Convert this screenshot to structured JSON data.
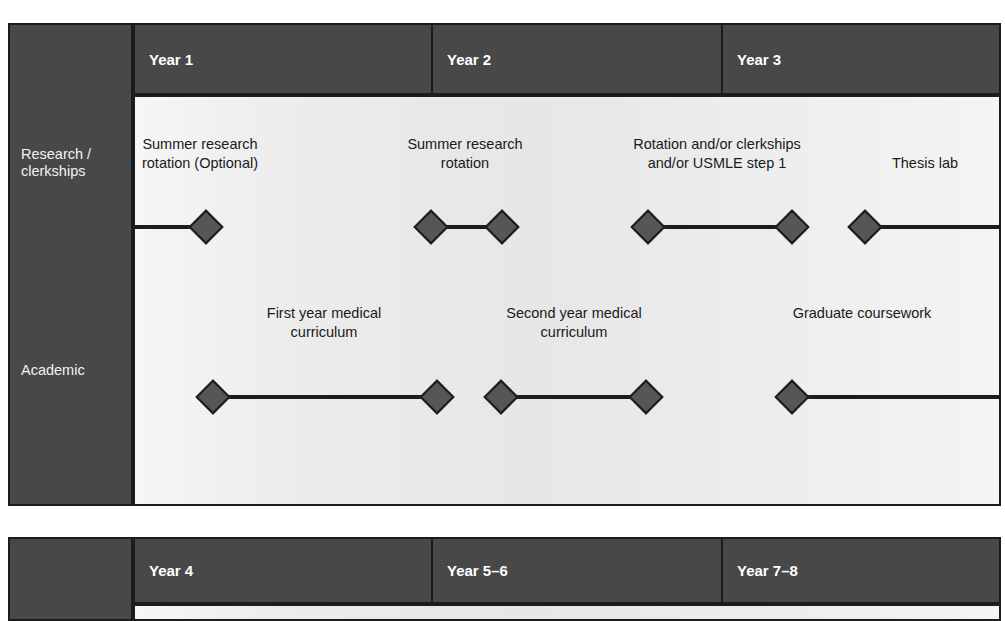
{
  "diagram": {
    "colors": {
      "header_dark": "#484848",
      "outline": "#1c1c1c",
      "plot_background": "#ebebeb",
      "diamond_fill": "#565656",
      "header_text": "#ffffff",
      "body_text": "#1a1a1a"
    }
  },
  "panels": [
    {
      "id": "panel-top",
      "row_labels": [
        {
          "id": "research",
          "label": "Research /\nclerkships"
        },
        {
          "id": "academic",
          "label": "Academic"
        }
      ],
      "years": [
        {
          "label": "Year 1"
        },
        {
          "label": "Year 2"
        },
        {
          "label": "Year 3"
        }
      ],
      "tracks": [
        {
          "id": "research-track",
          "groups": [
            {
              "label": "Summer research\nrotation (Optional)",
              "diamonds": 1,
              "start_open": true,
              "end_open": false
            },
            {
              "label": "Summer research\nrotation",
              "diamonds": 2,
              "start_open": false,
              "end_open": false
            },
            {
              "label": "Rotation and/or clerkships\nand/or USMLE step 1",
              "diamonds": 2,
              "start_open": false,
              "end_open": false
            },
            {
              "label": "Thesis lab",
              "diamonds": 1,
              "start_open": false,
              "end_open": true
            }
          ]
        },
        {
          "id": "academic-track",
          "groups": [
            {
              "label": "First year medical\ncurriculum",
              "diamonds": 2,
              "start_open": false,
              "end_open": false
            },
            {
              "label": "Second year medical\ncurriculum",
              "diamonds": 2,
              "start_open": false,
              "end_open": false
            },
            {
              "label": "Graduate coursework",
              "diamonds": 1,
              "start_open": false,
              "end_open": true
            }
          ]
        }
      ]
    },
    {
      "id": "panel-bottom",
      "row_labels": [],
      "years": [
        {
          "label": "Year 4"
        },
        {
          "label": "Year 5–6"
        },
        {
          "label": "Year 7–8"
        }
      ],
      "tracks": []
    }
  ]
}
